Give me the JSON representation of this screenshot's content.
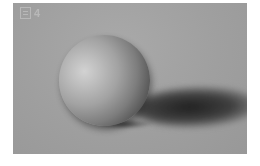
{
  "figure": {
    "label_icon": "figure-icon",
    "label_number": "4",
    "colors": {
      "background": "#a0a0a0",
      "highlight": "#d2d2d2",
      "core_shadow": "#4a4a4a",
      "cast_shadow": "#1e1e1e"
    }
  }
}
